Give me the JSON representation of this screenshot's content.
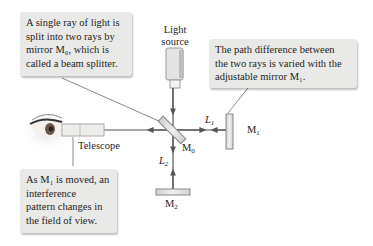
{
  "callouts": {
    "beam_splitter": {
      "lines": [
        "A single ray of light is",
        "split into two rays by",
        "mirror M₀, which is",
        "called a beam splitter."
      ]
    },
    "path_difference": {
      "lines": [
        "The path difference between",
        "the two rays is varied with the",
        "adjustable mirror M₁."
      ]
    },
    "interference": {
      "lines": [
        "As M₁ is moved, an",
        "interference",
        "pattern changes in",
        "the field of view."
      ]
    }
  },
  "labels": {
    "light_source_line1": "Light",
    "light_source_line2": "source",
    "telescope": "Telescope",
    "m0": "M",
    "m0_sub": "0",
    "m1": "M",
    "m1_sub": "1",
    "m2": "M",
    "m2_sub": "2",
    "l1": "L",
    "l1_sub": "1",
    "l2": "L",
    "l2_sub": "2"
  },
  "colors": {
    "callout_bg": "#e9e9e7",
    "ray": "#555555",
    "leader": "#8a8a8a",
    "mirror": "#d8d8d4"
  }
}
